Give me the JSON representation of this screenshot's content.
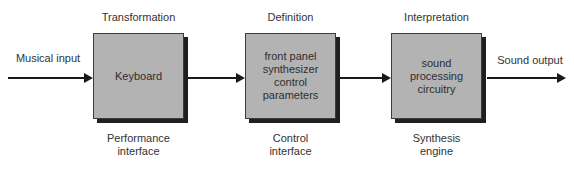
{
  "diagram": {
    "input_label": "Musical input",
    "output_label": "Sound output",
    "stages": [
      {
        "top_label": "Transformation",
        "box_text": "Keyboard",
        "bottom_label": "Performance\ninterface"
      },
      {
        "top_label": "Definition",
        "box_text": "front panel\nsynthesizer\ncontrol\nparameters",
        "bottom_label": "Control\ninterface"
      },
      {
        "top_label": "Interpretation",
        "box_text": "sound\nprocessing\ncircuitry",
        "bottom_label": "Synthesis\nengine"
      }
    ],
    "colors": {
      "background": "#ffffff",
      "box_fill": "#b3b3b3",
      "box_border": "#3c3c3c",
      "shadow": "#1f1f1f",
      "arrow": "#1a1a1a",
      "text": "#333333"
    }
  }
}
